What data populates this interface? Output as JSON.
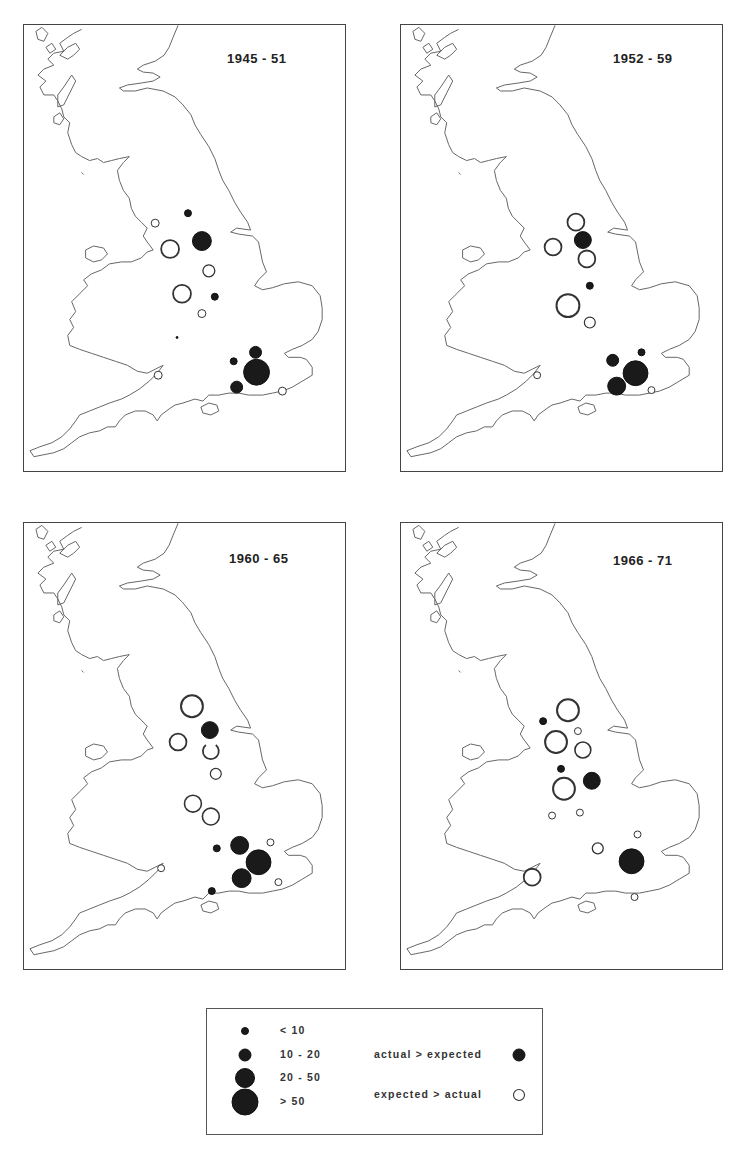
{
  "figure": {
    "panels": [
      {
        "id": "p1",
        "title": "1945 - 51"
      },
      {
        "id": "p2",
        "title": "1952 - 59"
      },
      {
        "id": "p3",
        "title": "1960 - 65"
      },
      {
        "id": "p4",
        "title": "1966 - 71"
      }
    ],
    "legend": {
      "size_classes": [
        {
          "label": "< 10",
          "radius": 4
        },
        {
          "label": "10 - 20",
          "radius": 6
        },
        {
          "label": "20 - 50",
          "radius": 10
        },
        {
          "label": "> 50",
          "radius": 13
        }
      ],
      "types": [
        {
          "label": "actual > expected",
          "style": "filled"
        },
        {
          "label": "expected > actual",
          "style": "open"
        }
      ]
    },
    "colors": {
      "ink": "#1a1a1a",
      "coast": "#666666",
      "background": "#ffffff"
    }
  },
  "map_data": {
    "region": "England and Wales",
    "symbol_meaning": "proportional circles; filled = actual > expected, open = expected > actual",
    "panels": [
      {
        "title": "1945 - 51",
        "symbols": [
          {
            "x": 165,
            "y": 189,
            "class": "< 10",
            "type": "filled"
          },
          {
            "x": 132,
            "y": 199,
            "class": "< 10",
            "type": "open"
          },
          {
            "x": 179,
            "y": 217,
            "class": "20 - 50",
            "type": "filled"
          },
          {
            "x": 147,
            "y": 225,
            "class": "20 - 50",
            "type": "open"
          },
          {
            "x": 186,
            "y": 247,
            "class": "10 - 20",
            "type": "open"
          },
          {
            "x": 159,
            "y": 270,
            "class": "20 - 50",
            "type": "open"
          },
          {
            "x": 192,
            "y": 273,
            "class": "< 10",
            "type": "filled"
          },
          {
            "x": 179,
            "y": 290,
            "class": "< 10",
            "type": "open"
          },
          {
            "x": 154,
            "y": 314,
            "class": "< 10",
            "type": "filled",
            "tiny": true
          },
          {
            "x": 135,
            "y": 352,
            "class": "< 10",
            "type": "open"
          },
          {
            "x": 211,
            "y": 338,
            "class": "< 10",
            "type": "filled"
          },
          {
            "x": 233,
            "y": 329,
            "class": "10 - 20",
            "type": "filled"
          },
          {
            "x": 234,
            "y": 349,
            "class": "> 50",
            "type": "filled"
          },
          {
            "x": 214,
            "y": 364,
            "class": "10 - 20",
            "type": "filled"
          },
          {
            "x": 260,
            "y": 368,
            "class": "< 10",
            "type": "open"
          }
        ]
      },
      {
        "title": "1952 - 59",
        "symbols": [
          {
            "x": 176,
            "y": 198,
            "class": "20 - 50",
            "type": "open"
          },
          {
            "x": 183,
            "y": 216,
            "class": "20 - 50",
            "type": "filled"
          },
          {
            "x": 153,
            "y": 223,
            "class": "20 - 50",
            "type": "open"
          },
          {
            "x": 187,
            "y": 235,
            "class": "20 - 50",
            "type": "open"
          },
          {
            "x": 190,
            "y": 262,
            "class": "< 10",
            "type": "filled"
          },
          {
            "x": 168,
            "y": 282,
            "class": "> 50",
            "type": "open"
          },
          {
            "x": 190,
            "y": 299,
            "class": "10 - 20",
            "type": "open"
          },
          {
            "x": 137,
            "y": 352,
            "class": "< 10",
            "type": "open"
          },
          {
            "x": 213,
            "y": 337,
            "class": "10 - 20",
            "type": "filled"
          },
          {
            "x": 242,
            "y": 329,
            "class": "< 10",
            "type": "filled"
          },
          {
            "x": 236,
            "y": 350,
            "class": "> 50",
            "type": "filled"
          },
          {
            "x": 217,
            "y": 363,
            "class": "20 - 50",
            "type": "filled"
          },
          {
            "x": 252,
            "y": 367,
            "class": "< 10",
            "type": "open"
          }
        ]
      },
      {
        "title": "1960 - 65",
        "symbols": [
          {
            "x": 169,
            "y": 184,
            "class": "> 50",
            "type": "open"
          },
          {
            "x": 187,
            "y": 208,
            "class": "20 - 50",
            "type": "filled"
          },
          {
            "x": 155,
            "y": 220,
            "class": "20 - 50",
            "type": "open"
          },
          {
            "x": 188,
            "y": 229,
            "class": "20 - 50",
            "type": "open"
          },
          {
            "x": 193,
            "y": 252,
            "class": "10 - 20",
            "type": "open"
          },
          {
            "x": 170,
            "y": 282,
            "class": "20 - 50",
            "type": "open"
          },
          {
            "x": 188,
            "y": 295,
            "class": "20 - 50",
            "type": "open"
          },
          {
            "x": 194,
            "y": 327,
            "class": "< 10",
            "type": "filled"
          },
          {
            "x": 217,
            "y": 324,
            "class": "20 - 50",
            "type": "filled"
          },
          {
            "x": 236,
            "y": 341,
            "class": "> 50",
            "type": "filled"
          },
          {
            "x": 219,
            "y": 357,
            "class": "20 - 50",
            "type": "filled"
          },
          {
            "x": 248,
            "y": 321,
            "class": "< 10",
            "type": "open"
          },
          {
            "x": 256,
            "y": 361,
            "class": "< 10",
            "type": "open"
          },
          {
            "x": 138,
            "y": 347,
            "class": "< 10",
            "type": "open"
          },
          {
            "x": 189,
            "y": 370,
            "class": "< 10",
            "type": "filled"
          }
        ]
      },
      {
        "title": "1966 - 71",
        "symbols": [
          {
            "x": 168,
            "y": 188,
            "class": "> 50",
            "type": "open"
          },
          {
            "x": 143,
            "y": 199,
            "class": "< 10",
            "type": "filled"
          },
          {
            "x": 178,
            "y": 209,
            "class": "< 10",
            "type": "open"
          },
          {
            "x": 156,
            "y": 220,
            "class": "> 50",
            "type": "open"
          },
          {
            "x": 183,
            "y": 228,
            "class": "20 - 50",
            "type": "open"
          },
          {
            "x": 161,
            "y": 247,
            "class": "< 10",
            "type": "filled"
          },
          {
            "x": 192,
            "y": 259,
            "class": "20 - 50",
            "type": "filled"
          },
          {
            "x": 164,
            "y": 267,
            "class": "> 50",
            "type": "open"
          },
          {
            "x": 152,
            "y": 294,
            "class": "< 10",
            "type": "open"
          },
          {
            "x": 180,
            "y": 291,
            "class": "< 10",
            "type": "open"
          },
          {
            "x": 198,
            "y": 327,
            "class": "10 - 20",
            "type": "open"
          },
          {
            "x": 238,
            "y": 313,
            "class": "< 10",
            "type": "open"
          },
          {
            "x": 232,
            "y": 340,
            "class": "> 50",
            "type": "filled"
          },
          {
            "x": 132,
            "y": 356,
            "class": "20 - 50",
            "type": "open"
          },
          {
            "x": 235,
            "y": 376,
            "class": "< 10",
            "type": "open"
          }
        ]
      }
    ]
  }
}
